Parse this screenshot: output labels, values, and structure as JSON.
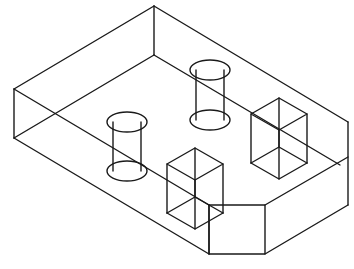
{
  "figure": {
    "stroke_color": "#1a1a1a",
    "background": "#ffffff",
    "stroke_width": 1.4
  }
}
